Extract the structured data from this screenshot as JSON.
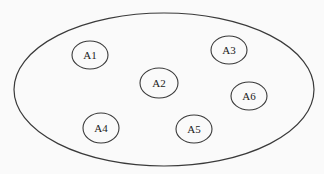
{
  "diagram": {
    "type": "set-containment",
    "container": {
      "label": ""
    },
    "nodes": [
      {
        "id": "A1",
        "label": "A1"
      },
      {
        "id": "A2",
        "label": "A2"
      },
      {
        "id": "A3",
        "label": "A3"
      },
      {
        "id": "A4",
        "label": "A4"
      },
      {
        "id": "A5",
        "label": "A5"
      },
      {
        "id": "A6",
        "label": "A6"
      }
    ],
    "colors": {
      "stroke": "#3a3a3a",
      "text": "#222222",
      "background": "#fafafa"
    }
  }
}
